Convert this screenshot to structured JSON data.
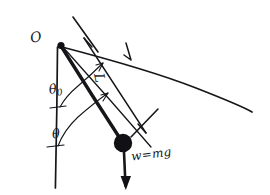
{
  "figure": {
    "style": "hand-drawn ink sketch on white paper",
    "background_color": "#ffffff",
    "ink_color": "#16161a"
  },
  "labels": {
    "pivot": "O",
    "rod_length": "L",
    "amplitude_angle": "θ",
    "amplitude_angle_subscript": "0",
    "displacement_angle": "θ",
    "weight": "w=mg"
  },
  "geometry": {
    "pivot_point": [
      61,
      45
    ],
    "bob_center": [
      123,
      143
    ],
    "bob_radius": 9,
    "vertical_reference_line": {
      "from": [
        57,
        47
      ],
      "to": [
        55,
        188
      ]
    },
    "pendulum_rod": {
      "from": [
        61,
        46
      ],
      "to": [
        121,
        140
      ],
      "stroke_width": 3.2
    },
    "weight_vector": {
      "from": [
        124,
        152
      ],
      "to": [
        126,
        188
      ],
      "direction": "down",
      "arrowhead": true
    },
    "length_dimension_line": {
      "from": [
        84,
        38
      ],
      "to": [
        146,
        133
      ],
      "tick_marks": 2
    },
    "long_diagonal_line": {
      "from": [
        62,
        47
      ],
      "to": [
        252,
        112
      ]
    },
    "amplitude_ray": {
      "from": [
        62,
        46
      ],
      "to": [
        151,
        147
      ]
    },
    "angle_arc_theta0": {
      "center": [
        59,
        46
      ],
      "radius": 60,
      "from_angle_deg": 90,
      "to_angle_deg": 46
    },
    "angle_arc_theta": {
      "center": [
        58,
        47
      ],
      "radius": 98,
      "from_angle_deg": 90,
      "to_angle_deg": 47
    }
  }
}
